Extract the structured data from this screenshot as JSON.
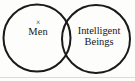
{
  "figure": {
    "type": "venn-diagram",
    "width": 135,
    "height": 81,
    "background_color": "#fdfdfc",
    "stroke_color": "#1a1a1a",
    "stroke_width": 2,
    "text_color": "#181818"
  },
  "sets": {
    "left": {
      "id": "men",
      "label": "Men",
      "mark": "×",
      "mark_name": "x-element-mark",
      "center_x": 37,
      "center_y": 38,
      "radius": 33.5
    },
    "right": {
      "id": "intelligent-beings",
      "label_line_1": "Intelligent",
      "label_line_2": "Beings",
      "center_x": 96,
      "center_y": 39,
      "radius": 34
    }
  },
  "artifacts": {
    "baseline_rule_color": "#cfcfcb"
  }
}
